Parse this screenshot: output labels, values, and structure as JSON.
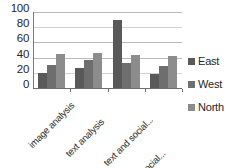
{
  "chart_data": {
    "type": "bar",
    "title": "",
    "subtitle": "",
    "xlabel": "",
    "ylabel": "",
    "ylim": [
      0,
      100
    ],
    "yticks": [
      "0",
      "20",
      "40",
      "60",
      "80",
      "100"
    ],
    "grid": true,
    "legend_position": "right",
    "categories": [
      "image analysis",
      "text analysis",
      "text and social...",
      "social..."
    ],
    "series": [
      {
        "name": "East",
        "color": "#595959",
        "values": [
          20,
          26,
          89,
          18
        ]
      },
      {
        "name": "West",
        "color": "#6e6e6e",
        "values": [
          30,
          37,
          33,
          29
        ]
      },
      {
        "name": "North",
        "color": "#8c8c8c",
        "values": [
          45,
          46,
          44,
          42
        ]
      }
    ]
  },
  "axis": {
    "y_ticks": [
      {
        "label": "100",
        "value": 100
      },
      {
        "label": "80",
        "value": 80
      },
      {
        "label": "60",
        "value": 60
      },
      {
        "label": "40",
        "value": 40
      },
      {
        "label": "20",
        "value": 20
      },
      {
        "label": "0",
        "value": 0
      }
    ]
  },
  "legend": {
    "items": [
      {
        "label": "East",
        "color": "#595959"
      },
      {
        "label": "West",
        "color": "#6e6e6e"
      },
      {
        "label": "North",
        "color": "#8c8c8c"
      }
    ]
  },
  "colors": {
    "gridline": "#b9b9b9",
    "axis": "#6e6e6e",
    "text": "#262626",
    "background": "#ffffff"
  }
}
